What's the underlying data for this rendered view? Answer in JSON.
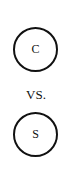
{
  "diagram": {
    "nodes": [
      {
        "label": "C"
      },
      {
        "label": "S"
      }
    ],
    "separator": "VS."
  }
}
